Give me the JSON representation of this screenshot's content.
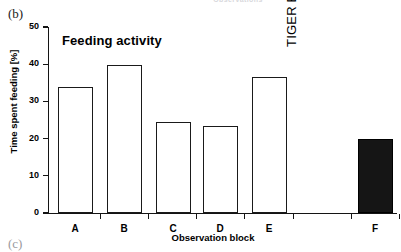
{
  "figure": {
    "panel_label": "(b)",
    "next_panel_label": "(c)",
    "cutoff_header": "Observations"
  },
  "chart_data": {
    "type": "bar",
    "title": "Feeding activity",
    "xlabel": "Observation block",
    "ylabel": "Time spent feeding [%]",
    "categories": [
      "A",
      "B",
      "C",
      "D",
      "E",
      "F"
    ],
    "values": [
      34.0,
      39.8,
      24.4,
      23.5,
      36.5,
      20.0
    ],
    "bar_styles": [
      "open",
      "open",
      "open",
      "open",
      "open",
      "filled"
    ],
    "ylim": [
      0,
      50
    ],
    "yticks": [
      0,
      10,
      20,
      30,
      40,
      50
    ],
    "ytick_labels": [
      "0",
      "10",
      "20",
      "30",
      "40",
      "50"
    ],
    "grid": false,
    "legend": false,
    "annotations": [
      {
        "text": "TIGER ENCOUNTER",
        "orientation": "vertical",
        "between": [
          "E",
          "F"
        ]
      }
    ],
    "colors": {
      "open_bar_fill": "#ffffff",
      "bar_edge": "#1a1a1a",
      "filled_bar_fill": "#151515",
      "axis": "#141414",
      "text": "#000000"
    }
  }
}
